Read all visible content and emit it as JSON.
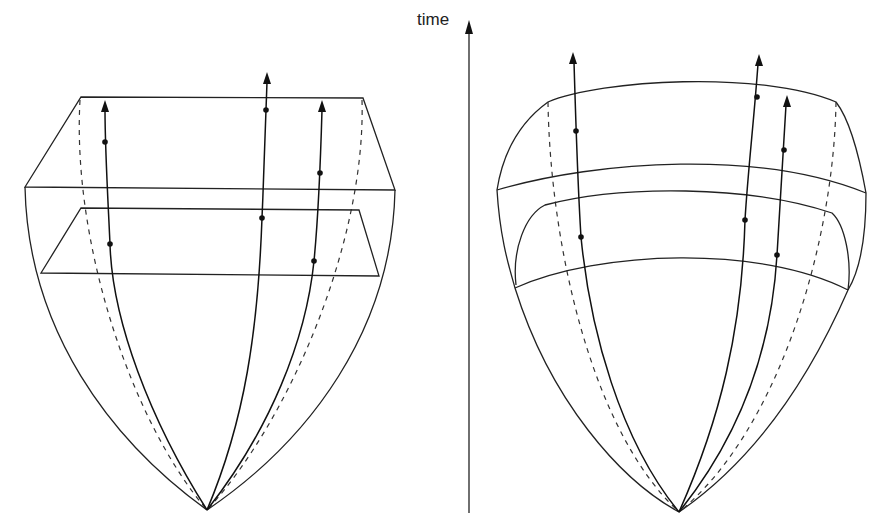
{
  "axis": {
    "label": "time",
    "direction": "up"
  },
  "figures": [
    {
      "name": "left-figure",
      "description": "Cone of spacetime with flat (planar) time slices",
      "slices": 2,
      "slice_shape": "flat",
      "trajectories": 3,
      "points_per_trajectory": 2
    },
    {
      "name": "right-figure",
      "description": "Cone of spacetime with curved time slices",
      "slices": 3,
      "slice_shape": "curved",
      "trajectories": 3,
      "points_per_trajectory": 2
    }
  ],
  "colors": {
    "line": "#222222",
    "background": "#ffffff"
  }
}
